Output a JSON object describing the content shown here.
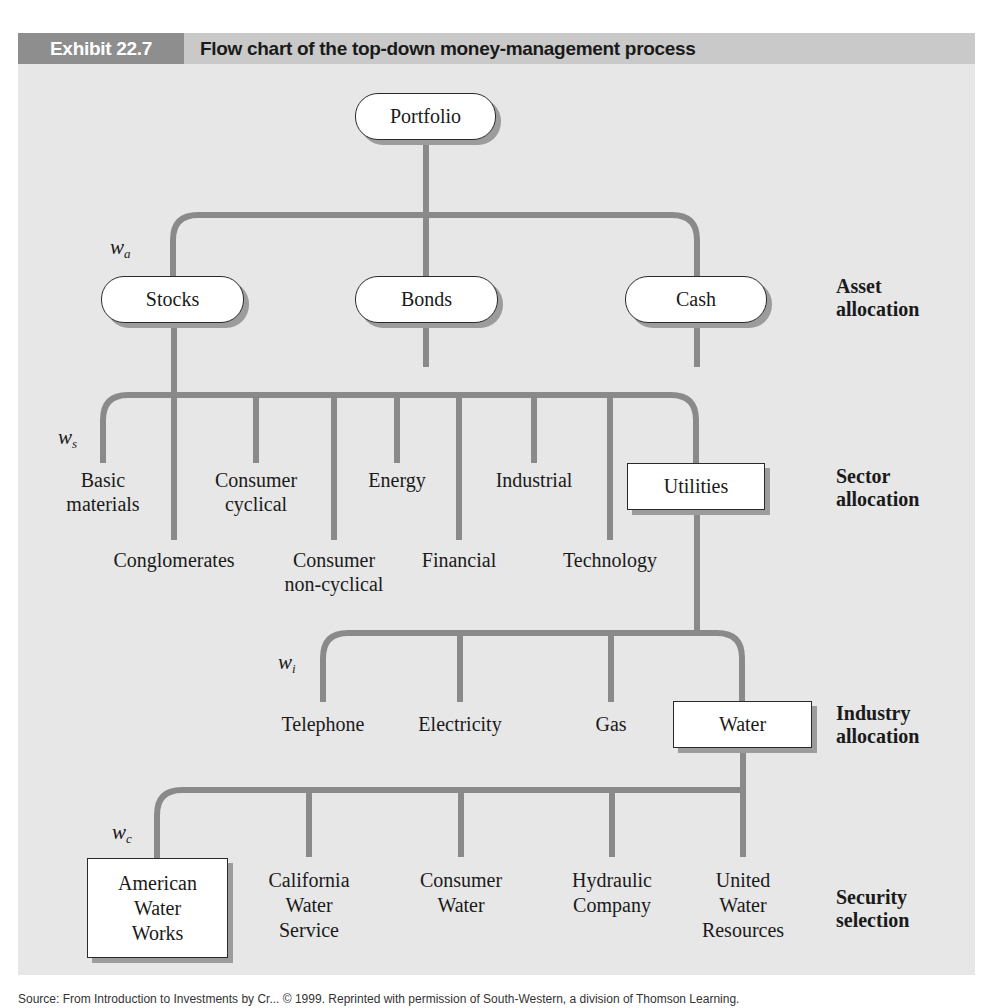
{
  "header": {
    "exhibit_tag": "Exhibit 22.7",
    "title": "Flow chart of the top-down money-management process"
  },
  "colors": {
    "panel_bg": "#e7e7e7",
    "header_bg": "#c9c9c9",
    "tag_bg": "#8e8e8e",
    "connector": "#8a8a8a",
    "node_fill": "#ffffff",
    "node_shadow": "#9c9c9c"
  },
  "root": {
    "label": "Portfolio"
  },
  "levels": [
    {
      "line1": "Asset",
      "line2": "allocation"
    },
    {
      "line1": "Sector",
      "line2": "allocation"
    },
    {
      "line1": "Industry",
      "line2": "allocation"
    },
    {
      "line1": "Security",
      "line2": "selection"
    }
  ],
  "weights": [
    {
      "symbol": "w",
      "sub": "a"
    },
    {
      "symbol": "w",
      "sub": "s"
    },
    {
      "symbol": "w",
      "sub": "i"
    },
    {
      "symbol": "w",
      "sub": "c"
    }
  ],
  "asset_classes": [
    {
      "label": "Stocks",
      "selected": true
    },
    {
      "label": "Bonds",
      "selected": false
    },
    {
      "label": "Cash",
      "selected": false
    }
  ],
  "sectors": [
    {
      "line1": "Basic",
      "line2": "materials"
    },
    {
      "line1": "Conglomerates",
      "line2": ""
    },
    {
      "line1": "Consumer",
      "line2": "cyclical"
    },
    {
      "line1": "Consumer",
      "line2": "non-cyclical"
    },
    {
      "line1": "Energy",
      "line2": ""
    },
    {
      "line1": "Financial",
      "line2": ""
    },
    {
      "line1": "Industrial",
      "line2": ""
    },
    {
      "line1": "Technology",
      "line2": ""
    },
    {
      "line1": "Utilities",
      "line2": "",
      "selected": true
    }
  ],
  "industries": [
    {
      "label": "Telephone"
    },
    {
      "label": "Electricity"
    },
    {
      "label": "Gas"
    },
    {
      "label": "Water",
      "selected": true
    }
  ],
  "securities": [
    {
      "line1": "American",
      "line2": "Water",
      "line3": "Works",
      "selected": true
    },
    {
      "line1": "California",
      "line2": "Water",
      "line3": "Service"
    },
    {
      "line1": "Consumer",
      "line2": "Water",
      "line3": ""
    },
    {
      "line1": "Hydraulic",
      "line2": "Company",
      "line3": ""
    },
    {
      "line1": "United",
      "line2": "Water",
      "line3": "Resources"
    }
  ],
  "source": "Source: From Introduction to Investments by Cr... © 1999. Reprinted with permission of South-Western, a division of Thomson Learning."
}
